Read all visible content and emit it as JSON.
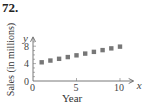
{
  "problem": {
    "number": "72."
  },
  "chart_data": {
    "type": "scatter",
    "title": "",
    "xlabel": "Year",
    "ylabel": "Sales (in millions)",
    "x_axis_var": "x",
    "y_axis_var": "y",
    "xlim": [
      0,
      11
    ],
    "ylim": [
      0,
      9
    ],
    "xticks": [
      0,
      5,
      10
    ],
    "yticks": [
      0,
      4,
      8
    ],
    "grid": false,
    "legend": null,
    "marker": "square",
    "marker_color": "#777777",
    "series": [
      {
        "name": "Sales",
        "x": [
          1,
          2,
          3,
          4,
          5,
          6,
          7,
          8,
          9,
          10
        ],
        "y": [
          4.3,
          4.7,
          5.1,
          5.5,
          5.9,
          6.3,
          6.7,
          7.1,
          7.5,
          7.9
        ]
      }
    ]
  }
}
